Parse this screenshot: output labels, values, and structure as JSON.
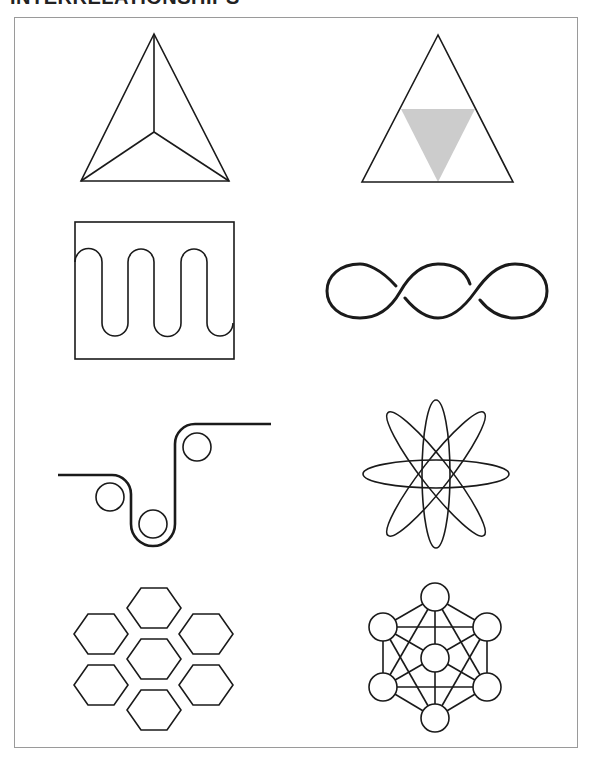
{
  "page": {
    "title": "INTERRELATIONSHIPS"
  },
  "colors": {
    "stroke": "#1a1a1a",
    "frame": "#9a9a9a",
    "shaded_triangle": "#cccccc",
    "background": "#ffffff"
  },
  "figures": [
    {
      "id": "triangle-with-center-lines",
      "row": 1,
      "col": 1
    },
    {
      "id": "triangle-with-shaded-inverted-triangle",
      "row": 1,
      "col": 2
    },
    {
      "id": "serpentine-in-box",
      "row": 2,
      "col": 1
    },
    {
      "id": "three-loop-chain",
      "row": 2,
      "col": 2
    },
    {
      "id": "belt-over-three-pulleys",
      "row": 3,
      "col": 1
    },
    {
      "id": "atom-orbits",
      "row": 3,
      "col": 2
    },
    {
      "id": "hexagon-cluster",
      "row": 4,
      "col": 1,
      "count": 7
    },
    {
      "id": "connected-node-network",
      "row": 4,
      "col": 2,
      "count": 7
    }
  ]
}
